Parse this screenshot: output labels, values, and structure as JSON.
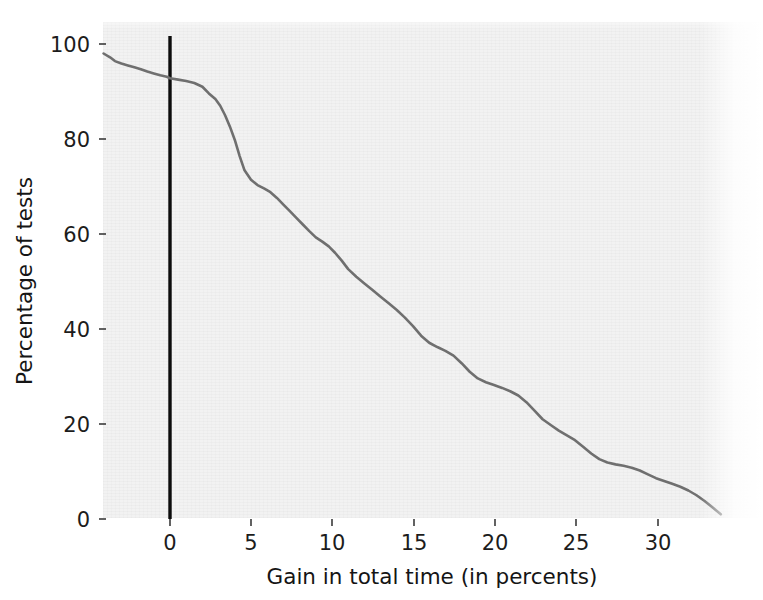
{
  "figure": {
    "background_color": "#ffffff",
    "plot_background_color": "#f2f2f2",
    "line_color": "#6f6f6f",
    "reference_line_color": "#0c0c0c"
  },
  "axes": {
    "x_title": "Gain in total time (in percents)",
    "y_title": "Percentage of tests",
    "x_ticks": [
      "0",
      "5",
      "10",
      "15",
      "20",
      "25",
      "30"
    ],
    "y_ticks": [
      "0",
      "20",
      "40",
      "60",
      "80",
      "100"
    ]
  },
  "annotations": {
    "reference_line_label": "x = 0 (no gain)"
  },
  "chart_data": {
    "type": "line",
    "title": "",
    "subtitle": "",
    "xlabel": "Gain in total time (in percents)",
    "ylabel": "Percentage of tests",
    "xlim": [
      -4.1,
      36.5
    ],
    "ylim": [
      -2.0,
      104.0
    ],
    "xticks": [
      0,
      5,
      10,
      15,
      20,
      25,
      30
    ],
    "yticks": [
      0,
      20,
      40,
      60,
      80,
      100
    ],
    "grid": false,
    "legend": null,
    "legend_position": "none",
    "annotations": [
      {
        "kind": "vertical-line",
        "x": 0,
        "label": "x = 0 (no gain)",
        "color": "#0c0c0c"
      }
    ],
    "series": [
      {
        "name": "Percentage of tests with at least this gain",
        "x": [
          -4.1,
          -3.7,
          -3.4,
          -3.0,
          -2.6,
          -2.2,
          -1.8,
          -1.4,
          -1.0,
          -0.6,
          -0.2,
          0.0,
          0.5,
          1.0,
          1.5,
          2.0,
          2.4,
          2.8,
          3.1,
          3.4,
          3.7,
          4.0,
          4.3,
          4.6,
          5.0,
          5.4,
          5.8,
          6.2,
          6.6,
          7.0,
          7.4,
          7.8,
          8.2,
          8.6,
          9.0,
          9.4,
          9.8,
          10.2,
          10.6,
          11.0,
          11.5,
          12.0,
          12.5,
          13.0,
          13.5,
          14.0,
          14.5,
          15.0,
          15.5,
          16.0,
          16.5,
          17.0,
          17.5,
          18.0,
          18.5,
          19.0,
          19.5,
          20.0,
          20.5,
          21.0,
          21.5,
          22.0,
          22.5,
          23.0,
          23.5,
          24.0,
          24.5,
          25.0,
          25.5,
          26.0,
          26.5,
          27.0,
          27.5,
          28.0,
          28.5,
          29.0,
          29.5,
          30.0,
          30.5,
          31.0,
          31.5,
          32.0,
          32.5,
          33.0,
          33.5,
          34.0
        ],
        "y": [
          98.0,
          97.2,
          96.4,
          95.9,
          95.5,
          95.1,
          94.7,
          94.2,
          93.8,
          93.4,
          93.1,
          92.8,
          92.5,
          92.2,
          91.8,
          91.0,
          89.6,
          88.4,
          87.0,
          85.0,
          82.6,
          79.8,
          76.4,
          73.4,
          71.4,
          70.3,
          69.6,
          68.8,
          67.6,
          66.2,
          64.8,
          63.4,
          62.0,
          60.6,
          59.3,
          58.4,
          57.4,
          56.0,
          54.4,
          52.6,
          51.0,
          49.6,
          48.2,
          46.8,
          45.4,
          44.0,
          42.4,
          40.6,
          38.6,
          37.1,
          36.2,
          35.4,
          34.4,
          32.8,
          31.0,
          29.6,
          28.8,
          28.2,
          27.6,
          26.9,
          26.0,
          24.6,
          22.8,
          21.0,
          19.8,
          18.6,
          17.6,
          16.6,
          15.2,
          13.8,
          12.6,
          11.9,
          11.5,
          11.2,
          10.8,
          10.2,
          9.4,
          8.6,
          8.0,
          7.4,
          6.8,
          6.0,
          5.0,
          3.8,
          2.4,
          1.0
        ]
      }
    ]
  }
}
